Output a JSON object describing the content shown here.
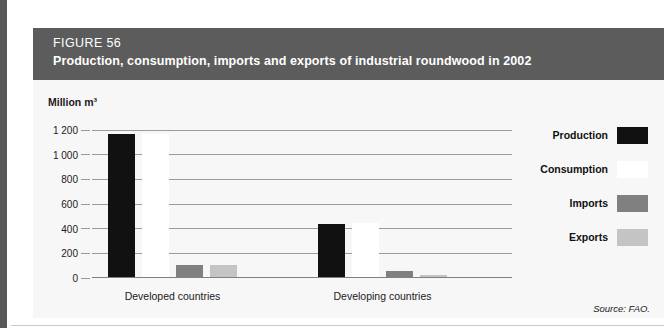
{
  "figure": {
    "number_label": "FIGURE 56",
    "title": "Production, consumption, imports and exports of industrial roundwood in 2002",
    "unit_label": "Million m³",
    "source": "Source: FAO."
  },
  "legend": {
    "items": [
      {
        "label": "Production",
        "color": "#111111"
      },
      {
        "label": "Consumption",
        "color": "#ffffff"
      },
      {
        "label": "Imports",
        "color": "#808080"
      },
      {
        "label": "Exports",
        "color": "#c4c4c4"
      }
    ]
  },
  "chart_data": {
    "type": "bar",
    "title": "Production, consumption, imports and exports of industrial roundwood in 2002",
    "xlabel": "",
    "ylabel": "Million m³",
    "ylim": [
      0,
      1200
    ],
    "yticks": [
      0,
      200,
      400,
      600,
      800,
      1000,
      1200
    ],
    "ytick_labels": [
      "0",
      "200",
      "400",
      "600",
      "800",
      "1 000",
      "1 200"
    ],
    "grid": true,
    "legend_position": "right",
    "categories": [
      "Developed countries",
      "Developing countries"
    ],
    "series": [
      {
        "name": "Production",
        "color": "#111111",
        "values": [
          1160,
          430
        ]
      },
      {
        "name": "Consumption",
        "color": "#ffffff",
        "values": [
          1160,
          440
        ]
      },
      {
        "name": "Imports",
        "color": "#808080",
        "values": [
          100,
          50
        ]
      },
      {
        "name": "Exports",
        "color": "#c4c4c4",
        "values": [
          100,
          12
        ]
      }
    ]
  }
}
